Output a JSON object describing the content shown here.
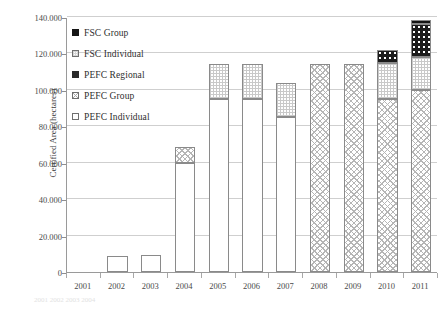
{
  "chart_data": {
    "type": "bar",
    "title": "",
    "xlabel": "",
    "ylabel": "Certified Area (hectares)",
    "ylim": [
      0,
      140000
    ],
    "ytick_step": 20000,
    "ytick_labels": [
      "0",
      "20.000",
      "40.000",
      "60.000",
      "80.000",
      "100.000",
      "120.000",
      "140.000"
    ],
    "ytick_values": [
      0,
      20000,
      40000,
      60000,
      80000,
      100000,
      120000,
      140000
    ],
    "grid": true,
    "stacked": true,
    "legend_position": "upper-left-inside",
    "categories": [
      "2001",
      "2002",
      "2003",
      "2004",
      "2005",
      "2006",
      "2007",
      "2008",
      "2009",
      "2010",
      "2011"
    ],
    "series": [
      {
        "name": "PEFC Individual",
        "swatch": "pefc-individual",
        "values": [
          0,
          9000,
          9500,
          60000,
          95000,
          95000,
          85000,
          0,
          0,
          0,
          0
        ]
      },
      {
        "name": "PEFC Group",
        "swatch": "pefc-group",
        "values": [
          0,
          0,
          0,
          8500,
          0,
          0,
          0,
          114000,
          114000,
          95000,
          100000
        ]
      },
      {
        "name": "PEFC Regional",
        "swatch": "pefc-regional",
        "values": [
          0,
          0,
          0,
          0,
          0,
          0,
          0,
          0,
          0,
          0,
          0
        ]
      },
      {
        "name": "FSC Individual",
        "swatch": "fsc-individual",
        "values": [
          0,
          0,
          0,
          0,
          19000,
          19000,
          19000,
          0,
          0,
          20000,
          18000
        ]
      },
      {
        "name": "FSC Group",
        "swatch": "fsc-group",
        "values": [
          0,
          0,
          0,
          0,
          0,
          0,
          0,
          0,
          0,
          7000,
          18000
        ]
      }
    ],
    "bar_totals": [
      0,
      9000,
      9500,
      68500,
      128000,
      128000,
      124000,
      114000,
      114000,
      122000,
      138500
    ]
  },
  "legend": {
    "items": [
      {
        "label": "FSC Group",
        "swatch": "fsc-group"
      },
      {
        "label": "FSC Individual",
        "swatch": "fsc-individual"
      },
      {
        "label": "PEFC Regional",
        "swatch": "pefc-regional"
      },
      {
        "label": "PEFC Group",
        "swatch": "pefc-group"
      },
      {
        "label": "PEFC Individual",
        "swatch": "pefc-individual"
      }
    ]
  },
  "axis": {
    "y_title": "Certified Area (hectares)"
  },
  "colors": {
    "axis_line": "#9a9a9a",
    "gridline": "#cfcfcf",
    "bar_outline": "#8a8a8a",
    "black_fill": "#141414",
    "text": "#3a3a3a"
  },
  "footer_ghost": "2001   2002   2003   2004"
}
